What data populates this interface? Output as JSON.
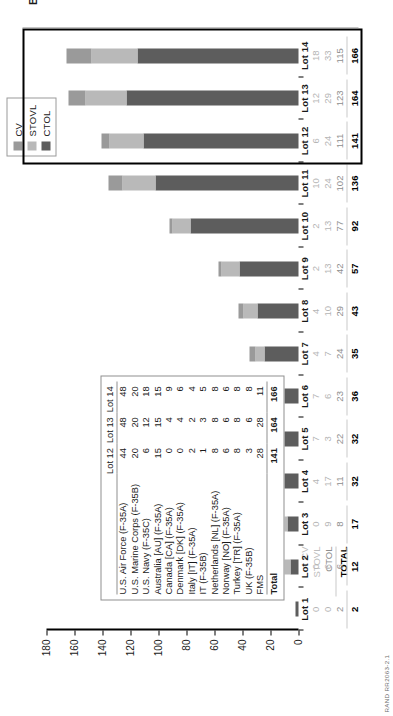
{
  "figure": {
    "y_axis_title": "Number of aircraft",
    "source_note": "RAND RR2063-2.1",
    "callout_title": "BB quantities\nTotal: 471"
  },
  "legend": {
    "items": [
      {
        "label": "CV",
        "color": "#9a9a9a"
      },
      {
        "label": "STOVL",
        "color": "#b9b9b9"
      },
      {
        "label": "CTOL",
        "color": "#5d5d5d"
      }
    ]
  },
  "row_keys": {
    "cv": "CV",
    "stovl": "STOVL",
    "ctol": "CTOL",
    "total": "TOTAL"
  },
  "chart_data": {
    "type": "bar",
    "title": "",
    "xlabel": "",
    "ylabel": "Number of aircraft",
    "ylim": [
      0,
      180
    ],
    "yticks": [
      0,
      20,
      40,
      60,
      80,
      100,
      120,
      140,
      160,
      180
    ],
    "grid": false,
    "legend_position": "top-right",
    "stacked": true,
    "categories": [
      "Lot 1",
      "Lot 2",
      "Lot 3",
      "Lot 4",
      "Lot 5",
      "Lot 6",
      "Lot 7",
      "Lot 8",
      "Lot 9",
      "Lot 10",
      "Lot 11",
      "Lot 12",
      "Lot 13",
      "Lot 14"
    ],
    "series": [
      {
        "name": "CTOL",
        "color": "#5d5d5d",
        "values": [
          2,
          6,
          8,
          11,
          22,
          23,
          24,
          29,
          42,
          77,
          102,
          111,
          123,
          115
        ]
      },
      {
        "name": "STOVL",
        "color": "#b9b9b9",
        "values": [
          0,
          6,
          9,
          17,
          3,
          6,
          7,
          10,
          13,
          13,
          24,
          24,
          29,
          33
        ]
      },
      {
        "name": "CV",
        "color": "#9a9a9a",
        "values": [
          0,
          0,
          0,
          4,
          7,
          7,
          4,
          4,
          2,
          2,
          10,
          6,
          12,
          18
        ]
      }
    ],
    "totals": [
      2,
      12,
      17,
      32,
      32,
      36,
      35,
      43,
      57,
      92,
      136,
      141,
      164,
      166
    ],
    "highlight_categories": [
      "Lot 12",
      "Lot 13",
      "Lot 14"
    ],
    "highlight_total": 471
  },
  "table": {
    "col_headers": [
      "",
      "Lot 12",
      "Lot 13",
      "Lot 14"
    ],
    "rows": [
      {
        "name": "U.S. Air Force (F-35A)",
        "values": [
          "44",
          "48",
          "48"
        ]
      },
      {
        "name": "U.S. Marine Corps (F-35B)",
        "values": [
          "20",
          "20",
          "20"
        ]
      },
      {
        "name": "U.S. Navy (F-35C)",
        "values": [
          "6",
          "12",
          "18"
        ]
      },
      {
        "name": "Australia [AU] (F-35A)",
        "values": [
          "15",
          "15",
          "15"
        ]
      },
      {
        "name": "Canada [CA] (F-35A)",
        "values": [
          "0",
          "4",
          "9"
        ]
      },
      {
        "name": "Denmark [DK] (F-35A)",
        "values": [
          "0",
          "4",
          "6"
        ]
      },
      {
        "name": "Italy [IT] (F-35A)",
        "values": [
          "2",
          "2",
          "4"
        ]
      },
      {
        "name": "IT (F-35B)",
        "values": [
          "1",
          "3",
          "5"
        ]
      },
      {
        "name": "Netherlands [NL] (F-35A)",
        "values": [
          "8",
          "8",
          "8"
        ]
      },
      {
        "name": "Norway [NO] (F-35A)",
        "values": [
          "6",
          "6",
          "6"
        ]
      },
      {
        "name": "Turkey [TR] (F-35A)",
        "values": [
          "8",
          "8",
          "8"
        ]
      },
      {
        "name": "UK (F-35B)",
        "values": [
          "3",
          "6",
          "8"
        ]
      },
      {
        "name": "FMS",
        "values": [
          "28",
          "28",
          "11"
        ]
      }
    ],
    "total_row": {
      "name": "Total",
      "values": [
        "141",
        "164",
        "166"
      ]
    }
  }
}
